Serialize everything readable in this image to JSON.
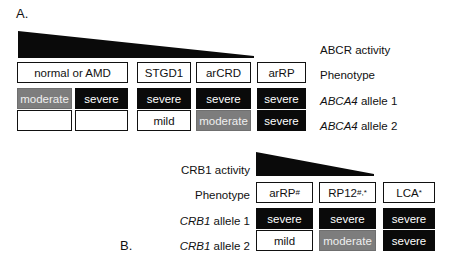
{
  "figure": {
    "colors": {
      "black": "#0a0a0a",
      "white": "#ffffff",
      "gray": "#7d7d7d",
      "text": "#111111"
    }
  },
  "panelA": {
    "letter": "A.",
    "wedge_label": "ABCR activity",
    "rows": {
      "activity": "ABCR activity",
      "phenotype": "Phenotype",
      "allele1": "ABCA4 allele 1",
      "allele2": "ABCA4 allele 2",
      "allele1_gene": "ABCA4",
      "allele1_suffix": " allele 1",
      "allele2_gene": "ABCA4",
      "allele2_suffix": " allele 2"
    },
    "phenotypes": [
      {
        "label": "normal or AMD"
      },
      {
        "label": "STGD1"
      },
      {
        "label": "arCRD"
      },
      {
        "label": "arRP"
      }
    ],
    "allele1": [
      {
        "label": "moderate",
        "fill": "gray"
      },
      {
        "label": "severe",
        "fill": "black"
      },
      {
        "label": "severe",
        "fill": "black"
      },
      {
        "label": "severe",
        "fill": "black"
      },
      {
        "label": "severe",
        "fill": "black"
      }
    ],
    "allele2": [
      {
        "label": "",
        "fill": "white"
      },
      {
        "label": "",
        "fill": "white"
      },
      {
        "label": "mild",
        "fill": "white"
      },
      {
        "label": "moderate",
        "fill": "gray"
      },
      {
        "label": "severe",
        "fill": "black"
      }
    ]
  },
  "panelB": {
    "letter": "B.",
    "rows": {
      "activity": "CRB1 activity",
      "phenotype": "Phenotype",
      "allele1_gene": "CRB1",
      "allele1_suffix": " allele 1",
      "allele2_gene": "CRB1",
      "allele2_suffix": " allele 2"
    },
    "phenotypes": [
      {
        "label": "arRP",
        "sup": "#"
      },
      {
        "label": "RP12",
        "sup": "#,*"
      },
      {
        "label": "LCA",
        "sup": "*"
      }
    ],
    "allele1": [
      {
        "label": "severe",
        "fill": "black"
      },
      {
        "label": "severe",
        "fill": "black"
      },
      {
        "label": "severe",
        "fill": "black"
      }
    ],
    "allele2": [
      {
        "label": "mild",
        "fill": "white"
      },
      {
        "label": "moderate",
        "fill": "gray"
      },
      {
        "label": "severe",
        "fill": "black"
      }
    ]
  }
}
